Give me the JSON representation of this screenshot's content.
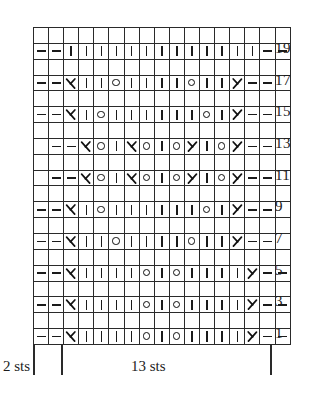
{
  "chart_data": {
    "type": "table",
    "columns": 17,
    "rows": 10,
    "row_label_side": "right",
    "grid": true,
    "legend_symbols": {
      "purl": "–",
      "knit": "|",
      "yarn_over": "O",
      "ssk": "λ",
      "k2tog": "ʎ"
    },
    "row_labels": [
      "19",
      "17",
      "15",
      "13",
      "11",
      "9",
      "7",
      "5",
      "3",
      "1"
    ],
    "rows_data": [
      {
        "label": "19",
        "cells": [
          "purl",
          "purl",
          "knit",
          "knit",
          "knit",
          "knit",
          "knit",
          "knit",
          "knit",
          "knit",
          "knit",
          "knit",
          "knit",
          "knit",
          "knit",
          "purl",
          "purl"
        ]
      },
      {
        "label": "17",
        "cells": [
          "purl",
          "purl",
          "ssk",
          "knit",
          "knit",
          "yo",
          "knit",
          "knit",
          "knit",
          "knit",
          "yo",
          "knit",
          "knit",
          "k2tog",
          "purl",
          "purl",
          "blank"
        ]
      },
      {
        "label": "15",
        "cells": [
          "purl",
          "purl",
          "ssk",
          "knit",
          "yo",
          "knit",
          "knit",
          "knit",
          "knit",
          "knit",
          "knit",
          "yo",
          "knit",
          "k2tog",
          "purl",
          "purl",
          "blank"
        ]
      },
      {
        "label": "13",
        "cells": [
          "purl",
          "purl",
          "ssk",
          "yo",
          "knit",
          "ssk",
          "yo",
          "knit",
          "yo",
          "k2tog",
          "knit",
          "yo",
          "k2tog",
          "purl",
          "purl",
          "blank",
          "blank"
        ]
      },
      {
        "label": "11",
        "cells": [
          "purl",
          "purl",
          "ssk",
          "yo",
          "knit",
          "ssk",
          "yo",
          "knit",
          "yo",
          "k2tog",
          "knit",
          "yo",
          "k2tog",
          "purl",
          "purl",
          "blank",
          "blank"
        ]
      },
      {
        "label": "9",
        "cells": [
          "purl",
          "purl",
          "ssk",
          "knit",
          "yo",
          "knit",
          "knit",
          "knit",
          "knit",
          "knit",
          "knit",
          "yo",
          "knit",
          "k2tog",
          "purl",
          "purl",
          "blank"
        ]
      },
      {
        "label": "7",
        "cells": [
          "purl",
          "purl",
          "ssk",
          "knit",
          "knit",
          "yo",
          "knit",
          "knit",
          "knit",
          "knit",
          "yo",
          "knit",
          "knit",
          "k2tog",
          "purl",
          "purl",
          "blank"
        ]
      },
      {
        "label": "5",
        "cells": [
          "purl",
          "purl",
          "ssk",
          "knit",
          "knit",
          "knit",
          "knit",
          "yo",
          "knit",
          "yo",
          "knit",
          "knit",
          "knit",
          "knit",
          "k2tog",
          "purl",
          "purl"
        ]
      },
      {
        "label": "3",
        "cells": [
          "purl",
          "purl",
          "ssk",
          "knit",
          "knit",
          "knit",
          "knit",
          "yo",
          "knit",
          "yo",
          "knit",
          "knit",
          "knit",
          "knit",
          "k2tog",
          "purl",
          "purl"
        ]
      },
      {
        "label": "1",
        "cells": [
          "purl",
          "purl",
          "ssk",
          "knit",
          "knit",
          "knit",
          "knit",
          "yo",
          "knit",
          "yo",
          "knit",
          "knit",
          "knit",
          "knit",
          "k2tog",
          "purl",
          "purl"
        ]
      }
    ]
  },
  "brackets": {
    "left_label": "2 sts",
    "right_label": "13 sts"
  },
  "colors": {
    "ink": "#1a1a1a",
    "grid": "#2a2a2a",
    "background": "#ffffff"
  }
}
